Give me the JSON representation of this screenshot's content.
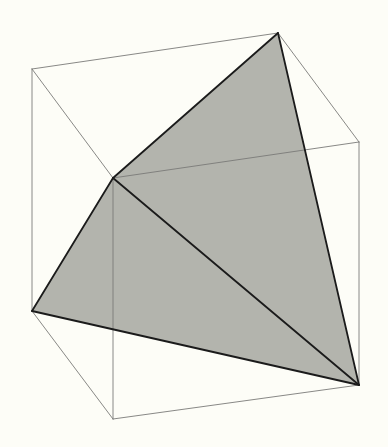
{
  "diagram": {
    "title": "",
    "background": "#fdfdf7",
    "fill_color": "#b3b4ad",
    "edge_color": "#7a7a78",
    "bold_color": "#1b1b1b",
    "cube_vertices": {
      "top_back_left": [
        32,
        69
      ],
      "top_back_right": [
        278,
        33
      ],
      "top_front_right": [
        359,
        142
      ],
      "top_front_left": [
        113,
        178
      ],
      "bottom_back_left": [
        32,
        311
      ],
      "bottom_front_right": [
        359,
        385
      ],
      "bottom_front_left": [
        113,
        419
      ]
    },
    "shaded_faces": [
      {
        "name": "face-upper",
        "points": [
          [
            278,
            33
          ],
          [
            113,
            178
          ],
          [
            359,
            385
          ]
        ]
      },
      {
        "name": "face-lower",
        "points": [
          [
            113,
            178
          ],
          [
            32,
            311
          ],
          [
            359,
            385
          ]
        ]
      }
    ],
    "bold_edges": [
      [
        [
          278,
          33
        ],
        [
          113,
          178
        ]
      ],
      [
        [
          278,
          33
        ],
        [
          359,
          385
        ]
      ],
      [
        [
          113,
          178
        ],
        [
          32,
          311
        ]
      ],
      [
        [
          113,
          178
        ],
        [
          359,
          385
        ]
      ],
      [
        [
          32,
          311
        ],
        [
          359,
          385
        ]
      ]
    ],
    "thin_edges": [
      [
        [
          32,
          69
        ],
        [
          278,
          33
        ]
      ],
      [
        [
          32,
          69
        ],
        [
          113,
          178
        ]
      ],
      [
        [
          278,
          33
        ],
        [
          359,
          142
        ]
      ],
      [
        [
          113,
          178
        ],
        [
          359,
          142
        ]
      ],
      [
        [
          32,
          69
        ],
        [
          32,
          311
        ]
      ],
      [
        [
          113,
          178
        ],
        [
          113,
          419
        ]
      ],
      [
        [
          359,
          142
        ],
        [
          359,
          385
        ]
      ],
      [
        [
          32,
          311
        ],
        [
          113,
          419
        ]
      ],
      [
        [
          113,
          419
        ],
        [
          359,
          385
        ]
      ]
    ]
  }
}
